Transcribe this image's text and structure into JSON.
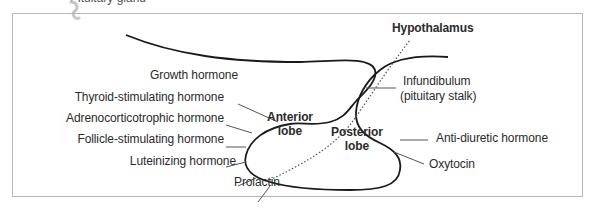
{
  "header": {
    "cut_text": "Pituitary gland"
  },
  "diagram": {
    "title_label": "Hypothalamus",
    "lobes": {
      "anterior": [
        "Anterior",
        "lobe"
      ],
      "posterior": [
        "Posterior",
        "lobe"
      ]
    },
    "anterior_hormones": [
      "Growth hormone",
      "Thyroid-stimulating hormone",
      "Adrenocorticotrophic hormone",
      "Follicle-stimulating hormone",
      "Luteinizing hormone",
      "Prolactin"
    ],
    "infundibulum": [
      "Infundibulum",
      "(pituitary stalk)"
    ],
    "posterior_hormones": [
      "Anti-diuretic hormone",
      "Oxytocin"
    ]
  }
}
